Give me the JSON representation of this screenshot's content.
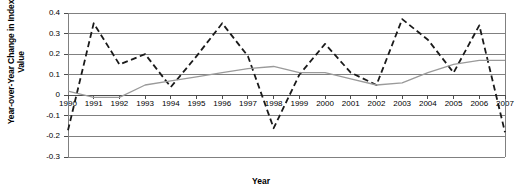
{
  "chart_data": {
    "type": "line",
    "title": "",
    "xlabel": "Year",
    "ylabel": "Year-over-Year Change in Index Value",
    "ylim": [
      -0.3,
      0.4
    ],
    "xlim": [
      1990,
      2007
    ],
    "grid": true,
    "legend": "none",
    "y_ticks": [
      "0.4",
      "0.3",
      "0.2",
      "0.1",
      "0",
      "-0.1",
      "-0.2",
      "-0.3"
    ],
    "y_tick_values": [
      0.4,
      0.3,
      0.2,
      0.1,
      0,
      -0.1,
      -0.2,
      -0.3
    ],
    "categories": [
      "1990",
      "1991",
      "1992",
      "1993",
      "1994",
      "1995",
      "1996",
      "1997",
      "1998",
      "1999",
      "2000",
      "2001",
      "2002",
      "2003",
      "2004",
      "2005",
      "2006",
      "2007"
    ],
    "x": [
      1990,
      1991,
      1992,
      1993,
      1994,
      1995,
      1996,
      1997,
      1998,
      1999,
      2000,
      2001,
      2002,
      2003,
      2004,
      2005,
      2006,
      2007
    ],
    "series": [
      {
        "name": "dashed-series",
        "style": "dashed",
        "color": "#1a1a1a",
        "values": [
          -0.17,
          0.35,
          0.15,
          0.2,
          0.04,
          0.19,
          0.35,
          0.19,
          -0.16,
          0.1,
          0.25,
          0.11,
          0.05,
          0.37,
          0.27,
          0.11,
          0.34,
          -0.18
        ]
      },
      {
        "name": "solid-series",
        "style": "solid",
        "color": "#9a9a9a",
        "values": [
          0.02,
          -0.01,
          -0.01,
          0.05,
          0.07,
          0.09,
          0.11,
          0.13,
          0.14,
          0.11,
          0.11,
          0.08,
          0.05,
          0.06,
          0.11,
          0.15,
          0.17,
          0.17
        ]
      }
    ]
  },
  "axes": {
    "y_title": "Year-over-Year Change in Index Value",
    "x_title": "Year"
  }
}
